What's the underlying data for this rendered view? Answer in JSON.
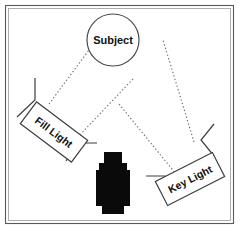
{
  "diagram": {
    "type": "lighting-diagram",
    "canvas": {
      "width": 240,
      "height": 230,
      "background": "#ffffff"
    },
    "frame": {
      "outer_stroke": "#5a5a5a",
      "inner_stroke": "#9a9a9a",
      "fill": "#ffffff"
    },
    "subject": {
      "label": "Subject",
      "shape": "circle",
      "center_x": 113,
      "center_y": 40,
      "radius": 26,
      "stroke": "#4a4a4a",
      "fill": "#ffffff"
    },
    "fill_light": {
      "label": "Fill Light",
      "shape": "rotated-rectangle",
      "rotation_deg": 37,
      "center_x": 54,
      "center_y": 132,
      "width": 64,
      "height": 27,
      "stroke": "#3d3d3d",
      "fill": "#ffffff"
    },
    "key_light": {
      "label": "Key Light",
      "shape": "rotated-rectangle",
      "rotation_deg": -27,
      "center_x": 190,
      "center_y": 179,
      "width": 64,
      "height": 27,
      "stroke": "#3d3d3d",
      "fill": "#ffffff"
    },
    "camera": {
      "label": "camera",
      "shape": "camera-silhouette",
      "color": "#0a0a0a",
      "center_x": 113,
      "center_y": 183
    },
    "rays": [
      {
        "name": "fill-light-to-subject",
        "style": "dotted",
        "color": "#6e6e6e"
      },
      {
        "name": "key-light-to-subject",
        "style": "dotted",
        "color": "#6e6e6e"
      },
      {
        "name": "camera-to-fill-light",
        "style": "dotted",
        "color": "#6e6e6e"
      },
      {
        "name": "camera-to-key-light",
        "style": "dotted",
        "color": "#6e6e6e"
      }
    ]
  }
}
